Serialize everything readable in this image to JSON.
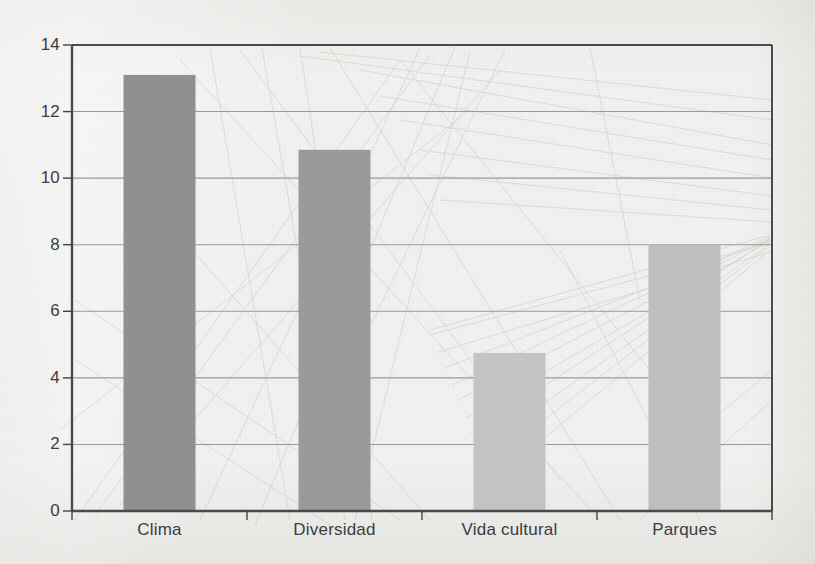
{
  "chart_data": {
    "type": "bar",
    "title": "",
    "subtitle": "",
    "xlabel": "",
    "ylabel": "",
    "categories": [
      "Clima",
      "Diversidad",
      "Vida cultural",
      "Parques"
    ],
    "values": [
      13.1,
      10.85,
      4.75,
      8.0
    ],
    "series": [
      {
        "name": "",
        "values": [
          13.1,
          10.85,
          4.75,
          8.0
        ]
      }
    ],
    "ylim": [
      0,
      14
    ],
    "yticks": [
      0,
      2,
      4,
      6,
      8,
      10,
      12,
      14
    ],
    "ytick_labels": [
      "0",
      "2",
      "4",
      "6",
      "8",
      "10",
      "12",
      "14"
    ],
    "xtick_labels": [
      "Clima",
      "Diversidad",
      "Vida cultural",
      "Parques"
    ],
    "grid": true,
    "grid_axis": "y",
    "legend": false,
    "legend_position": "none",
    "annotations": [],
    "bar_colors": [
      "#909090",
      "#9a9a9a",
      "#c3c3c3",
      "#bebebe"
    ]
  },
  "figure": {
    "background_color": "#f1f1ef",
    "axis_color": "#444444",
    "grid_color": "#9a9a9a",
    "tick_label_color": "#3d3d3d"
  }
}
